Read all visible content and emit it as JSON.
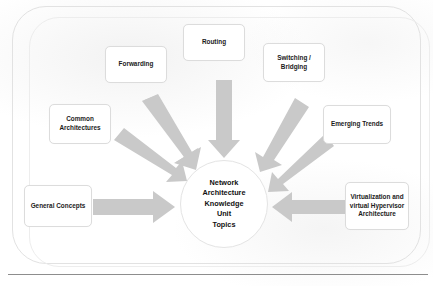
{
  "figure": {
    "center": {
      "label": "Network\nArchitecture\nKnowledge\nUnit\nTopics",
      "line1": "Network",
      "line2": "Architecture",
      "line3": "Knowledge",
      "line4": "Unit",
      "line5": "Topics"
    },
    "topics": [
      {
        "id": "forwarding",
        "label": "Forwarding"
      },
      {
        "id": "routing",
        "label": "Routing"
      },
      {
        "id": "switching",
        "label": "Switching /\nBridging"
      },
      {
        "id": "common-arch",
        "label": "Common\nArchitectures"
      },
      {
        "id": "emerging-trends",
        "label": "Emerging Trends"
      },
      {
        "id": "general-concepts",
        "label": "General Concepts"
      },
      {
        "id": "virtualization",
        "label": "Virtualization and\nvirtual Hypervisor\nArchitecture"
      }
    ],
    "caption": "",
    "colors": {
      "arrow": "#c9c9c9",
      "box_border": "#dcdcdc",
      "box_fill": "#ffffff",
      "text": "#111111",
      "frame": "#e2e2e2",
      "rule": "#8d8d8d"
    }
  }
}
